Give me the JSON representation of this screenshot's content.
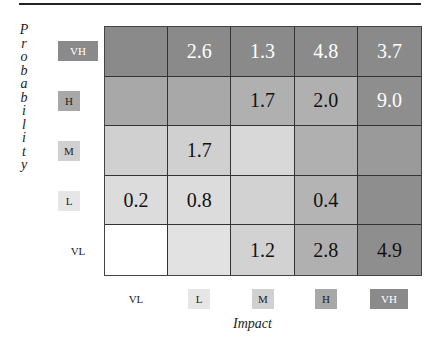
{
  "chart_data": {
    "type": "heatmap",
    "title": "",
    "xlabel": "Impact",
    "ylabel": "Probability",
    "x_categories": [
      "VL",
      "L",
      "M",
      "H",
      "VH"
    ],
    "y_categories": [
      "VH",
      "H",
      "M",
      "L",
      "VL"
    ],
    "values": [
      [
        null,
        2.6,
        1.3,
        4.8,
        3.7
      ],
      [
        null,
        null,
        1.7,
        2.0,
        9.0
      ],
      [
        null,
        1.7,
        null,
        null,
        null
      ],
      [
        0.2,
        0.8,
        null,
        0.4,
        null
      ],
      [
        null,
        null,
        1.2,
        2.8,
        4.9
      ]
    ],
    "cell_text": [
      [
        "",
        "2.6",
        "1.3",
        "4.8",
        "3.7"
      ],
      [
        "",
        "",
        "1.7",
        "2.0",
        "9.0"
      ],
      [
        "",
        "1.7",
        "",
        "",
        ""
      ],
      [
        "0.2",
        "0.8",
        "",
        "0.4",
        ""
      ],
      [
        "",
        "",
        "1.2",
        "2.8",
        "4.9"
      ]
    ],
    "cell_colors": [
      [
        "#8a8a8a",
        "#8a8a8a",
        "#8a8a8a",
        "#8a8a8a",
        "#8a8a8a"
      ],
      [
        "#a8a8a8",
        "#a8a8a8",
        "#b0b0b0",
        "#b0b0b0",
        "#8e8e8e"
      ],
      [
        "#d0d0d0",
        "#d0d0d0",
        "#d8d8d8",
        "#b0b0b0",
        "#9a9a9a"
      ],
      [
        "#dcdcdc",
        "#dcdcdc",
        "#d2d2d2",
        "#b4b4b4",
        "#8e8e8e"
      ],
      [
        "#ffffff",
        "#e2e2e2",
        "#d2d2d2",
        "#b0b0b0",
        "#8e8e8e"
      ]
    ],
    "text_colors": [
      [
        "#fff",
        "#fff",
        "#fff",
        "#fff",
        "#fff"
      ],
      [
        "#111",
        "#111",
        "#111",
        "#111",
        "#fff"
      ],
      [
        "#111",
        "#111",
        "#111",
        "#111",
        "#111"
      ],
      [
        "#111",
        "#111",
        "#111",
        "#111",
        "#111"
      ],
      [
        "#111",
        "#111",
        "#111",
        "#111",
        "#111"
      ]
    ],
    "grid": true,
    "legend": "none"
  },
  "row_labels": [
    {
      "text": "VH",
      "bg": "#8a8a8a",
      "color": "#ffffff"
    },
    {
      "text": "H",
      "bg": "#a8a8a8",
      "color": "#222222"
    },
    {
      "text": "M",
      "bg": "#d0d0d0",
      "color": "#222222"
    },
    {
      "text": "L",
      "bg": "#e6e6e6",
      "color": "#222222"
    },
    {
      "text": "VL",
      "bg": "transparent",
      "color": "#222222"
    }
  ],
  "col_labels": [
    {
      "text": "VL",
      "bg": "transparent",
      "color": "#222222"
    },
    {
      "text": "L",
      "bg": "#e6e6e6",
      "color": "#222222"
    },
    {
      "text": "M",
      "bg": "#d0d0d0",
      "color": "#222222"
    },
    {
      "text": "H",
      "bg": "#a8a8a8",
      "color": "#222222"
    },
    {
      "text": "VH",
      "bg": "#8a8a8a",
      "color": "#ffffff"
    }
  ],
  "ylabel_letters": [
    "P",
    "r",
    "o",
    "b",
    "a",
    "b",
    "i",
    "l",
    "i",
    "t",
    "y"
  ],
  "xlabel": "Impact"
}
